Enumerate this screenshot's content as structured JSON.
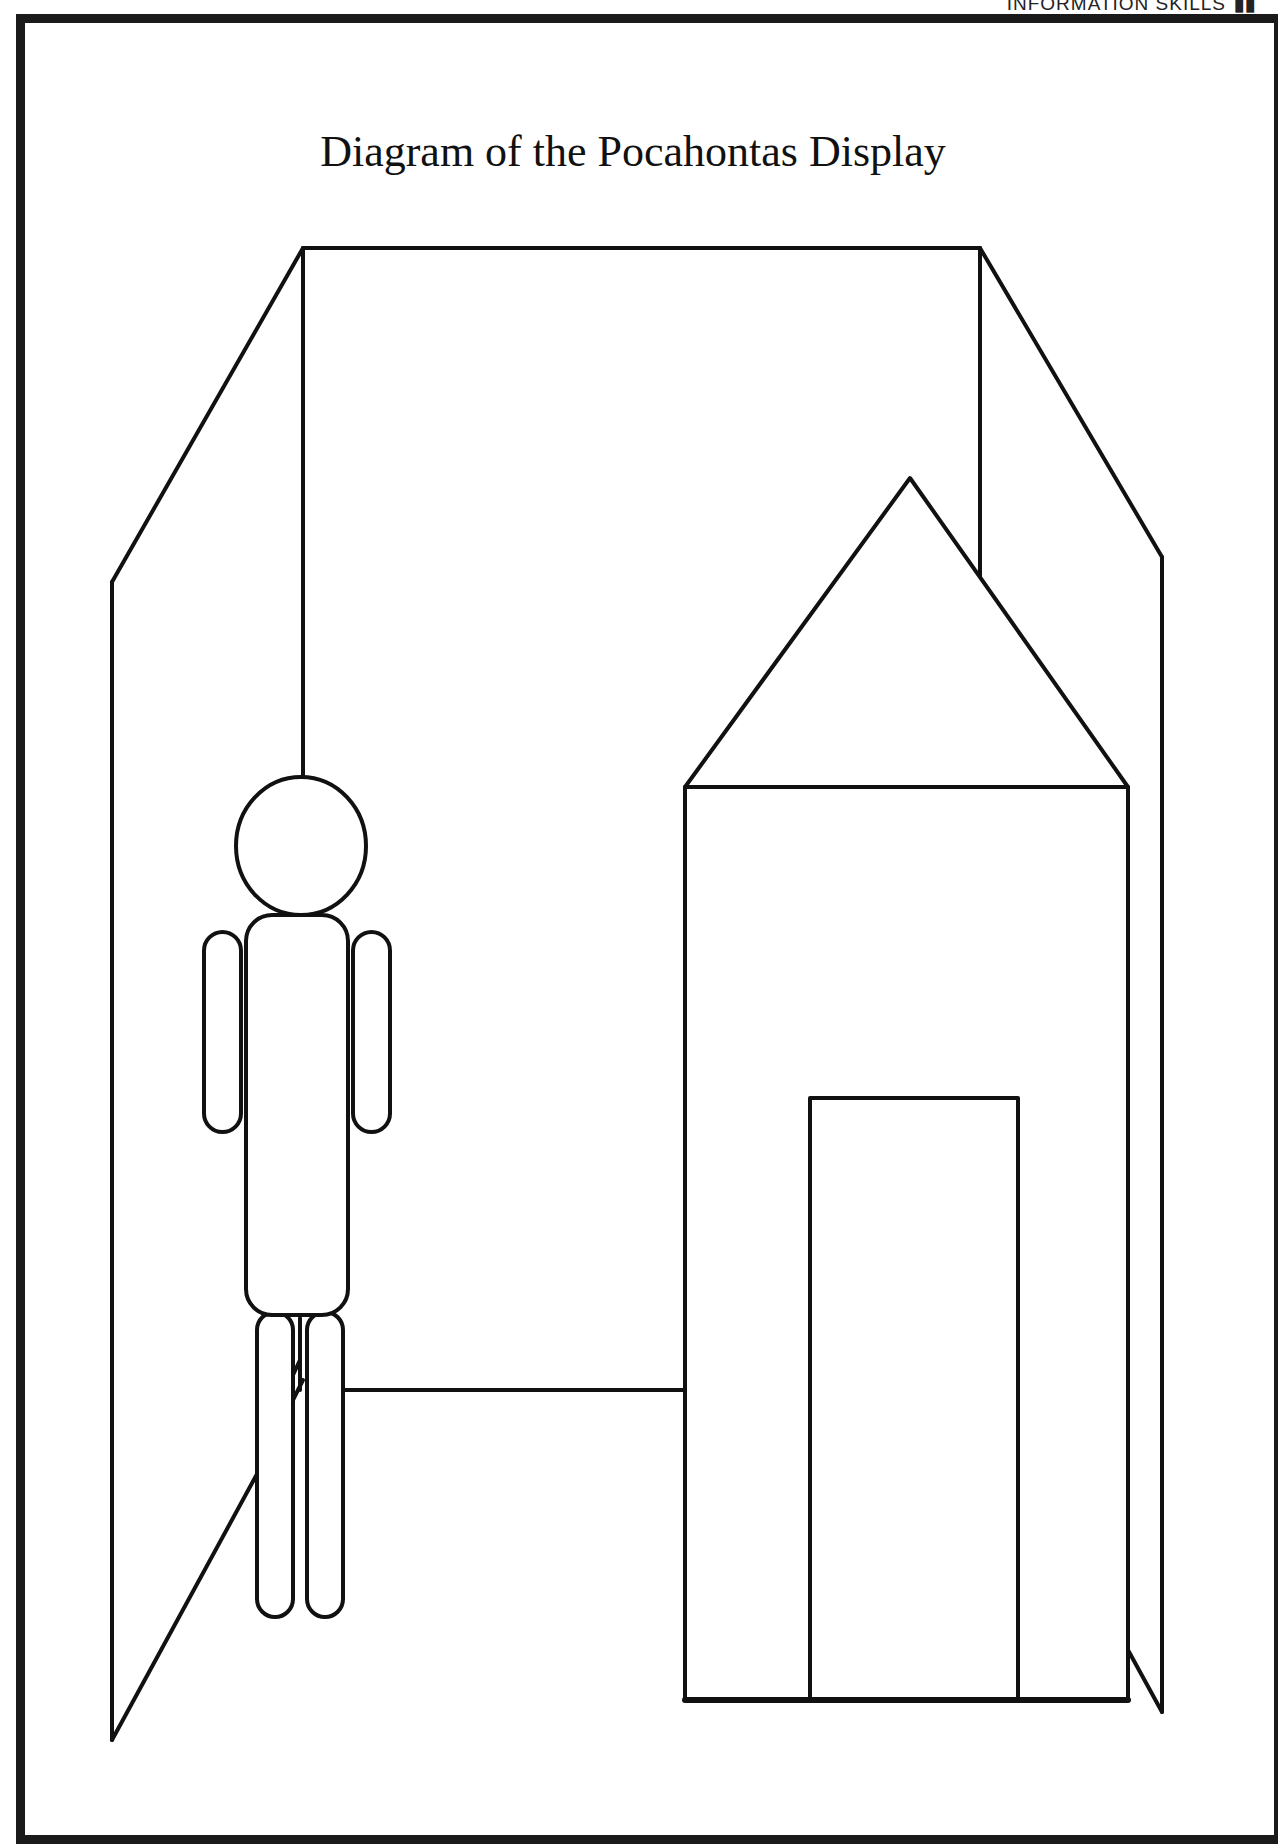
{
  "running_head": {
    "text": "INFORMATION SKILLS",
    "mark": "▮▮"
  },
  "diagram": {
    "title": "Diagram of the Pocahontas Display",
    "elements": [
      {
        "name": "left-side-panel",
        "description": "Angled left wall of the display"
      },
      {
        "name": "back-panel",
        "description": "Rear wall of the display"
      },
      {
        "name": "right-side-panel",
        "description": "Angled right wall of the display"
      },
      {
        "name": "floor-line",
        "description": "Floor edge of the display"
      },
      {
        "name": "figure",
        "description": "Simple human figure hanging from the ceiling line"
      },
      {
        "name": "house",
        "description": "House shape with pointed roof"
      },
      {
        "name": "house-door",
        "description": "Rectangular doorway on the house"
      }
    ],
    "stroke_color": "#111111",
    "background_color": "#ffffff"
  }
}
